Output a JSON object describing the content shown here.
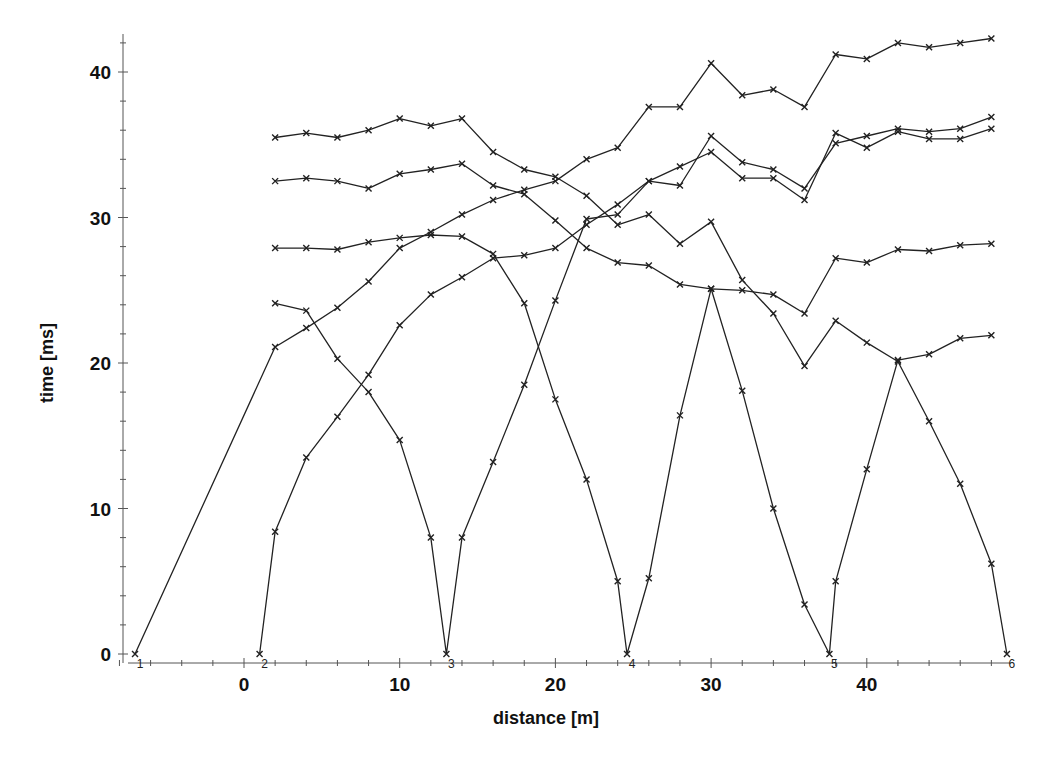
{
  "chart_data": {
    "type": "line",
    "title": "",
    "xlabel": "distance [m]",
    "ylabel": "time [ms]",
    "xlim": [
      -9.5,
      50
    ],
    "ylim": [
      -0.5,
      42.5
    ],
    "xticks": [
      0,
      10,
      20,
      30,
      40
    ],
    "yticks": [
      0,
      10,
      20,
      30,
      40
    ],
    "grid": false,
    "legend": "none",
    "marker": "x",
    "color": "#222222",
    "shots": [
      {
        "label": "1",
        "x": -7
      },
      {
        "label": "2",
        "x": 1
      },
      {
        "label": "3",
        "x": 13
      },
      {
        "label": "4",
        "x": 24.6
      },
      {
        "label": "5",
        "x": 37.6
      },
      {
        "label": "6",
        "x": 49
      }
    ],
    "series": [
      {
        "name": "shot 1",
        "x": [
          -7,
          2,
          4,
          6,
          8,
          10,
          12,
          14,
          16,
          18,
          20,
          22,
          24,
          26,
          28,
          30,
          32,
          34,
          36,
          38,
          40,
          42,
          44,
          46,
          48
        ],
        "y": [
          0,
          21.1,
          22.4,
          23.8,
          25.6,
          27.9,
          29.0,
          30.2,
          31.2,
          31.9,
          32.5,
          34.0,
          34.8,
          37.6,
          37.6,
          40.6,
          38.4,
          38.8,
          37.6,
          41.2,
          40.9,
          42.0,
          41.7,
          42.0,
          42.3
        ]
      },
      {
        "name": "shot 2",
        "x": [
          1,
          2,
          4,
          6,
          8,
          10,
          12,
          14,
          16,
          18,
          20,
          22,
          24,
          26,
          28,
          30,
          32,
          34,
          36,
          38,
          40,
          42,
          44,
          46,
          48
        ],
        "y": [
          0,
          8.4,
          13.5,
          16.3,
          19.2,
          22.6,
          24.7,
          25.9,
          27.2,
          27.4,
          27.9,
          29.5,
          30.9,
          32.5,
          33.5,
          34.5,
          32.7,
          32.7,
          31.2,
          35.8,
          34.8,
          35.9,
          35.4,
          35.4,
          36.1
        ]
      },
      {
        "name": "shot 3",
        "x": [
          2,
          4,
          6,
          8,
          10,
          12,
          13,
          14,
          16,
          18,
          20,
          22,
          24,
          26,
          28,
          30,
          32,
          34,
          36,
          38,
          40,
          42,
          44,
          46,
          48
        ],
        "y": [
          24.1,
          23.6,
          20.3,
          18.0,
          14.7,
          8.0,
          0,
          8.0,
          13.2,
          18.5,
          24.3,
          29.9,
          30.2,
          32.5,
          32.2,
          35.6,
          33.8,
          33.3,
          32.0,
          35.1,
          35.6,
          36.1,
          35.9,
          36.1,
          36.9
        ]
      },
      {
        "name": "shot 4",
        "x": [
          2,
          4,
          6,
          8,
          10,
          12,
          14,
          16,
          18,
          20,
          22,
          24,
          24.6,
          26,
          28,
          30,
          32,
          34,
          36,
          38,
          40,
          42,
          44,
          46,
          48
        ],
        "y": [
          27.9,
          27.9,
          27.8,
          28.3,
          28.6,
          28.8,
          28.7,
          27.5,
          24.1,
          17.5,
          12.0,
          5.0,
          0,
          5.2,
          16.4,
          25.1,
          25.0,
          24.7,
          23.4,
          27.2,
          26.9,
          27.8,
          27.7,
          28.1,
          28.2
        ]
      },
      {
        "name": "shot 5",
        "x": [
          2,
          4,
          6,
          8,
          10,
          12,
          14,
          16,
          18,
          20,
          22,
          24,
          26,
          28,
          30,
          32,
          34,
          36,
          37.6,
          38,
          40,
          42,
          44,
          46,
          48
        ],
        "y": [
          32.5,
          32.7,
          32.5,
          32.0,
          33.0,
          33.3,
          33.7,
          32.2,
          31.6,
          29.8,
          27.9,
          26.9,
          26.7,
          25.4,
          25.1,
          18.1,
          10.0,
          3.4,
          0,
          5.0,
          12.7,
          20.2,
          20.6,
          21.7,
          21.9
        ]
      },
      {
        "name": "shot 6",
        "x": [
          2,
          4,
          6,
          8,
          10,
          12,
          14,
          16,
          18,
          20,
          22,
          24,
          26,
          28,
          30,
          32,
          34,
          36,
          38,
          40,
          42,
          44,
          46,
          48,
          49
        ],
        "y": [
          35.5,
          35.8,
          35.5,
          36.0,
          36.8,
          36.3,
          36.8,
          34.5,
          33.3,
          32.8,
          31.5,
          29.5,
          30.2,
          28.2,
          29.7,
          25.7,
          23.4,
          19.8,
          22.9,
          21.4,
          20.1,
          16.0,
          11.7,
          6.2,
          0
        ]
      }
    ]
  },
  "axes": {
    "x_title": "distance [m]",
    "y_title": "time [ms]",
    "x_tick_labels": [
      "0",
      "10",
      "20",
      "30",
      "40"
    ],
    "y_tick_labels": [
      "0",
      "10",
      "20",
      "30",
      "40"
    ]
  }
}
